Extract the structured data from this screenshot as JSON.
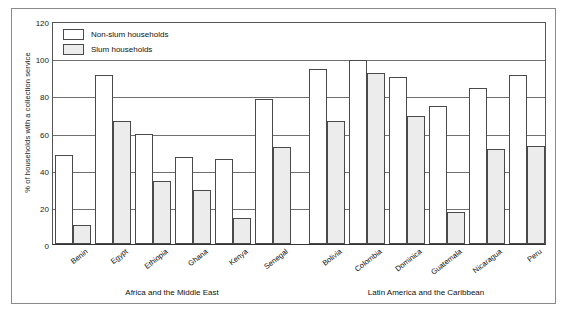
{
  "chart_data": {
    "type": "bar",
    "title": "",
    "xlabel": "",
    "ylabel": "% of households with a collection service",
    "ylim": [
      0,
      120
    ],
    "yticks": [
      0,
      20,
      40,
      60,
      80,
      100,
      120
    ],
    "grid": true,
    "legend_position": "top-left",
    "categories": [
      "Benin",
      "Egypt",
      "Ethiopia",
      "Ghana",
      "Kenya",
      "Senegal",
      "Bolivia",
      "Colombia",
      "Dominica",
      "Guatemala",
      "Nicaragua",
      "Peru"
    ],
    "groups": [
      {
        "label": "Africa and the Middle East",
        "categories": [
          "Benin",
          "Egypt",
          "Ethiopia",
          "Ghana",
          "Kenya",
          "Senegal"
        ]
      },
      {
        "label": "Latin America and the Caribbean",
        "categories": [
          "Bolivia",
          "Colombia",
          "Dominica",
          "Guatemala",
          "Nicaragua",
          "Peru"
        ]
      }
    ],
    "series": [
      {
        "name": "Non-slum households",
        "color": "#ffffff",
        "values": [
          48,
          91,
          59,
          47,
          46,
          78,
          94,
          99,
          90,
          74,
          84,
          91
        ]
      },
      {
        "name": "Slum households",
        "color": "#ececec",
        "values": [
          10,
          66,
          34,
          29,
          14,
          52,
          66,
          92,
          69,
          17,
          51,
          53
        ]
      }
    ]
  }
}
